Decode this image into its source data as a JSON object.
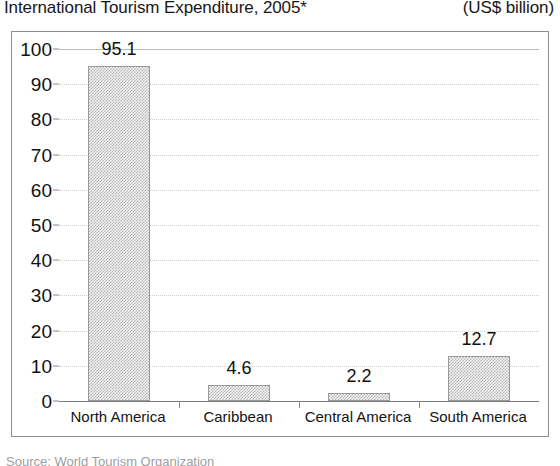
{
  "header": {
    "title": "International Tourism Expenditure, 2005*",
    "unit": "(US$ billion)"
  },
  "footer": {
    "source": "Source: World Tourism Organization"
  },
  "chart_data": {
    "type": "bar",
    "title": "International Tourism Expenditure, 2005*",
    "subtitle": "(US$ billion)",
    "xlabel": "",
    "ylabel": "",
    "unit": "US$ billion",
    "year": "2005*",
    "categories": [
      "North America",
      "Caribbean",
      "Central America",
      "South America"
    ],
    "values": [
      95.1,
      4.6,
      2.2,
      12.7
    ],
    "data_labels": [
      "95.1",
      "4.6",
      "2.2",
      "12.7"
    ],
    "ylim": [
      0,
      100
    ],
    "ytick_step": 10,
    "yticks": [
      100,
      90,
      80,
      70,
      60,
      50,
      40,
      30,
      20,
      10,
      0
    ],
    "ytick_labels": [
      "100",
      "90",
      "80",
      "70",
      "60",
      "50",
      "40",
      "30",
      "20",
      "10",
      "0"
    ],
    "grid": true,
    "grid_style": "dotted",
    "legend": false,
    "legend_position": "none",
    "bar_fill": "#d7d7d7",
    "bar_pattern": "checkerboard-dither",
    "bar_border": "#9a9a9a",
    "frame_color": "#8d8d8d",
    "axis_color": "#7a7a7a",
    "gridline_color": "#cfcfcf",
    "text_color": "#111111"
  }
}
